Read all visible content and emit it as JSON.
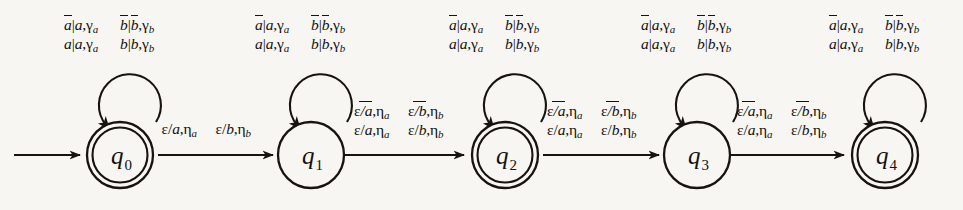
{
  "figure": {
    "kind": "finite-state-transducer-diagram",
    "background_color": "#f7f6f3",
    "ink_color": "#15110e",
    "start_arrow": "start-arrow-into-q0"
  },
  "states": [
    {
      "id": "q0",
      "name": "q",
      "subscript": "0",
      "accepting": true,
      "cx": 120,
      "cy": 155,
      "r": 33
    },
    {
      "id": "q1",
      "name": "q",
      "subscript": "1",
      "accepting": false,
      "cx": 311,
      "cy": 155,
      "r": 33
    },
    {
      "id": "q2",
      "name": "q",
      "subscript": "2",
      "accepting": true,
      "cx": 505,
      "cy": 155,
      "r": 33
    },
    {
      "id": "q3",
      "name": "q",
      "subscript": "3",
      "accepting": false,
      "cx": 697,
      "cy": 155,
      "r": 33
    },
    {
      "id": "q4",
      "name": "q",
      "subscript": "4",
      "accepting": true,
      "cx": 885,
      "cy": 155,
      "r": 33
    }
  ],
  "self_loops": [
    {
      "state": "q0",
      "label_lines": [
        [
          {
            "left": "a",
            "left_bar": true,
            "mid": "|",
            "right": "a",
            "right_bar": false,
            "out": "γ",
            "out_sub": "a"
          },
          {
            "left": "b",
            "left_bar": true,
            "mid": "|",
            "right": "b",
            "right_bar": true,
            "out": "γ",
            "out_sub": "b"
          }
        ],
        [
          {
            "left": "a",
            "left_bar": false,
            "mid": "|",
            "right": "a",
            "right_bar": false,
            "out": "γ",
            "out_sub": "a"
          },
          {
            "left": "b",
            "left_bar": false,
            "mid": "|",
            "right": "b",
            "right_bar": false,
            "out": "γ",
            "out_sub": "b"
          }
        ]
      ]
    },
    {
      "state": "q1",
      "label_lines": [
        [
          {
            "left": "a",
            "left_bar": true,
            "mid": "|",
            "right": "a",
            "right_bar": false,
            "out": "γ",
            "out_sub": "a"
          },
          {
            "left": "b",
            "left_bar": true,
            "mid": "|",
            "right": "b",
            "right_bar": true,
            "out": "γ",
            "out_sub": "b"
          }
        ],
        [
          {
            "left": "a",
            "left_bar": false,
            "mid": "|",
            "right": "a",
            "right_bar": false,
            "out": "γ",
            "out_sub": "a"
          },
          {
            "left": "b",
            "left_bar": false,
            "mid": "|",
            "right": "b",
            "right_bar": false,
            "out": "γ",
            "out_sub": "b"
          }
        ]
      ]
    },
    {
      "state": "q2",
      "label_lines": [
        [
          {
            "left": "a",
            "left_bar": true,
            "mid": "|",
            "right": "a",
            "right_bar": false,
            "out": "γ",
            "out_sub": "a"
          },
          {
            "left": "b",
            "left_bar": true,
            "mid": "|",
            "right": "b",
            "right_bar": true,
            "out": "γ",
            "out_sub": "b"
          }
        ],
        [
          {
            "left": "a",
            "left_bar": false,
            "mid": "|",
            "right": "a",
            "right_bar": false,
            "out": "γ",
            "out_sub": "a"
          },
          {
            "left": "b",
            "left_bar": false,
            "mid": "|",
            "right": "b",
            "right_bar": false,
            "out": "γ",
            "out_sub": "b"
          }
        ]
      ]
    },
    {
      "state": "q3",
      "label_lines": [
        [
          {
            "left": "a",
            "left_bar": true,
            "mid": "|",
            "right": "a",
            "right_bar": false,
            "out": "γ",
            "out_sub": "a"
          },
          {
            "left": "b",
            "left_bar": true,
            "mid": "|",
            "right": "b",
            "right_bar": true,
            "out": "γ",
            "out_sub": "b"
          }
        ],
        [
          {
            "left": "a",
            "left_bar": false,
            "mid": "|",
            "right": "a",
            "right_bar": false,
            "out": "γ",
            "out_sub": "a"
          },
          {
            "left": "b",
            "left_bar": false,
            "mid": "|",
            "right": "b",
            "right_bar": false,
            "out": "γ",
            "out_sub": "b"
          }
        ]
      ]
    },
    {
      "state": "q4",
      "label_lines": [
        [
          {
            "left": "a",
            "left_bar": true,
            "mid": "|",
            "right": "a",
            "right_bar": false,
            "out": "γ",
            "out_sub": "a"
          },
          {
            "left": "b",
            "left_bar": true,
            "mid": "|",
            "right": "b",
            "right_bar": true,
            "out": "γ",
            "out_sub": "b"
          }
        ],
        [
          {
            "left": "a",
            "left_bar": false,
            "mid": "|",
            "right": "a",
            "right_bar": false,
            "out": "γ",
            "out_sub": "a"
          },
          {
            "left": "b",
            "left_bar": false,
            "mid": "|",
            "right": "b",
            "right_bar": false,
            "out": "γ",
            "out_sub": "b"
          }
        ]
      ]
    }
  ],
  "transitions": [
    {
      "from": "q0",
      "to": "q1",
      "label_lines": [
        [
          {
            "eps": "ε",
            "slash": "/",
            "sym": "a",
            "bar": false,
            "out": "η",
            "out_sub": "a"
          },
          {
            "eps": "ε",
            "slash": "/",
            "sym": "b",
            "bar": false,
            "out": "η",
            "out_sub": "b"
          }
        ]
      ]
    },
    {
      "from": "q1",
      "to": "q2",
      "label_lines": [
        [
          {
            "eps": "ε",
            "slash": "/",
            "sym": "a",
            "bar": true,
            "out": "η",
            "out_sub": "a"
          },
          {
            "eps": "ε",
            "slash": "/",
            "sym": "b",
            "bar": true,
            "out": "η",
            "out_sub": "b"
          }
        ],
        [
          {
            "eps": "ε",
            "slash": "/",
            "sym": "a",
            "bar": false,
            "out": "η",
            "out_sub": "a"
          },
          {
            "eps": "ε",
            "slash": "/",
            "sym": "b",
            "bar": false,
            "out": "η",
            "out_sub": "b"
          }
        ]
      ]
    },
    {
      "from": "q2",
      "to": "q3",
      "label_lines": [
        [
          {
            "eps": "ε",
            "slash": "/",
            "sym": "a",
            "bar": true,
            "out": "η",
            "out_sub": "a"
          },
          {
            "eps": "ε",
            "slash": "/",
            "sym": "b",
            "bar": true,
            "out": "η",
            "out_sub": "b"
          }
        ],
        [
          {
            "eps": "ε",
            "slash": "/",
            "sym": "a",
            "bar": false,
            "out": "η",
            "out_sub": "a"
          },
          {
            "eps": "ε",
            "slash": "/",
            "sym": "b",
            "bar": false,
            "out": "η",
            "out_sub": "b"
          }
        ]
      ]
    },
    {
      "from": "q3",
      "to": "q4",
      "label_lines": [
        [
          {
            "eps": "ε",
            "slash": "/",
            "sym": "a",
            "bar": true,
            "out": "η",
            "out_sub": "a"
          },
          {
            "eps": "ε",
            "slash": "/",
            "sym": "b",
            "bar": true,
            "out": "η",
            "out_sub": "b"
          }
        ],
        [
          {
            "eps": "ε",
            "slash": "/",
            "sym": "a",
            "bar": false,
            "out": "η",
            "out_sub": "a"
          },
          {
            "eps": "ε",
            "slash": "/",
            "sym": "b",
            "bar": false,
            "out": "η",
            "out_sub": "b"
          }
        ]
      ]
    }
  ]
}
